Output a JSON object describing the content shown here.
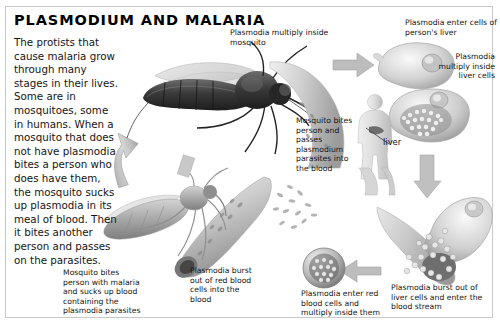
{
  "page": {
    "title": "PLASMODIUM AND MALARIA",
    "background_color": "#ffffff",
    "frame_color": "#c9c9c9",
    "text_color": "#141414",
    "art_color": "#9a9a9a"
  },
  "intro": {
    "text": "The protists that cause malaria grow through many stages in their lives. Some are in mosquitoes, some in humans. When a mosquito that does not have plasmodia bites a person who does have them, the mosquito sucks up plasmodia in its meal of blood. Then it bites another person and passes on the parasites."
  },
  "captions": {
    "multiply_in_mosquito": "Plasmodia multiply inside mosquito",
    "enter_liver_cells": "Plasmodia enter cells of person's liver",
    "multiply_in_liver_cells": "Plasmodia multiply inside liver cells",
    "mosquito_bites_person": "Mosquito bites person and passes plasmodium parasites into the blood",
    "burst_out_liver": "Plasmodia burst out of liver cells and enter the blood stream",
    "enter_red_blood_cells": "Plasmodia enter red blood cells and multiply inside them",
    "burst_out_red_cells": "Plasmodia burst out of red blood cells into the blood",
    "mosquito_bites_malaria": "Mosquito bites person with malaria and sucks up blood containing the plasmodia parasites"
  },
  "labels": {
    "liver": "liver"
  },
  "figures": {
    "mosquito_dark": "mosquito-feeding-illustration",
    "mosquito_light": "mosquito-second-illustration",
    "human_body": "human-figure-illustration",
    "liver_cell_empty": "liver-cell-illustration",
    "liver_cell_full": "liver-cell-with-plasmodia-illustration",
    "liver_cell_bursting": "bursting-liver-cell-illustration",
    "red_blood_cell_infected": "infected-red-blood-cell-illustration",
    "blood_vessel_upper": "blood-vessel-illustration",
    "blood_vessel_lower": "blood-vessel-bursting-illustration"
  },
  "arrows": {
    "up_left": "arrow-up-left",
    "right_top": "arrow-right-to-liver",
    "down_right": "arrow-down-right",
    "left_bottom": "arrow-left-bottom",
    "left_mid": "arrow-left-middle",
    "up_right_cycle": "arrow-up-right-cycle"
  }
}
